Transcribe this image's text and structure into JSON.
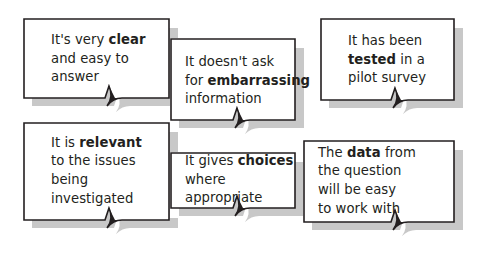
{
  "diagram": {
    "background_color": "#ffffff",
    "bubble_fill": "#ffffff",
    "bubble_border_color": "#231f20",
    "bubble_shadow_color": "#9a9a9a",
    "text_color": "#231f20",
    "bubbles": [
      {
        "id": "clear-and-easy",
        "name": "bubble-clear",
        "lines": [
          [
            {
              "t": "It's very ",
              "b": false
            },
            {
              "t": "clear",
              "b": true
            }
          ],
          [
            {
              "t": "and easy to",
              "b": false
            }
          ],
          [
            {
              "t": "answer",
              "b": false
            }
          ]
        ],
        "plain_text": "It's very clear and easy to answer",
        "emphasis": "clear"
      },
      {
        "id": "no-embarrassing",
        "name": "bubble-embarrassing",
        "lines": [
          [
            {
              "t": "It doesn't ask",
              "b": false
            }
          ],
          [
            {
              "t": "for ",
              "b": false
            },
            {
              "t": "embarrassing",
              "b": true
            }
          ],
          [
            {
              "t": "information",
              "b": false
            }
          ]
        ],
        "plain_text": "It doesn't ask for embarrassing information",
        "emphasis": "embarrassing"
      },
      {
        "id": "pilot-tested",
        "name": "bubble-tested",
        "lines": [
          [
            {
              "t": "It has been",
              "b": false
            }
          ],
          [
            {
              "t": "tested",
              "b": true
            },
            {
              "t": " in a",
              "b": false
            }
          ],
          [
            {
              "t": "pilot survey",
              "b": false
            }
          ]
        ],
        "plain_text": "It has been tested in a pilot survey",
        "emphasis": "tested"
      },
      {
        "id": "relevant",
        "name": "bubble-relevant",
        "lines": [
          [
            {
              "t": "It is ",
              "b": false
            },
            {
              "t": "relevant",
              "b": true
            }
          ],
          [
            {
              "t": "to the issues",
              "b": false
            }
          ],
          [
            {
              "t": "being",
              "b": false
            }
          ],
          [
            {
              "t": "investigated",
              "b": false
            }
          ]
        ],
        "plain_text": "It is relevant to the issues being investigated",
        "emphasis": "relevant"
      },
      {
        "id": "gives-choices",
        "name": "bubble-choices",
        "lines": [
          [
            {
              "t": "It gives ",
              "b": false
            },
            {
              "t": "choices",
              "b": true
            }
          ],
          [
            {
              "t": "where",
              "b": false
            }
          ],
          [
            {
              "t": "appropriate",
              "b": false
            }
          ]
        ],
        "plain_text": "It gives choices where appropriate",
        "emphasis": "choices"
      },
      {
        "id": "easy-data",
        "name": "bubble-data",
        "lines": [
          [
            {
              "t": "The ",
              "b": false
            },
            {
              "t": "data",
              "b": true
            },
            {
              "t": " from",
              "b": false
            }
          ],
          [
            {
              "t": "the question",
              "b": false
            }
          ],
          [
            {
              "t": "will be easy",
              "b": false
            }
          ],
          [
            {
              "t": "to work with",
              "b": false
            }
          ]
        ],
        "plain_text": "The data from the question will be easy to work with",
        "emphasis": "data"
      }
    ]
  }
}
